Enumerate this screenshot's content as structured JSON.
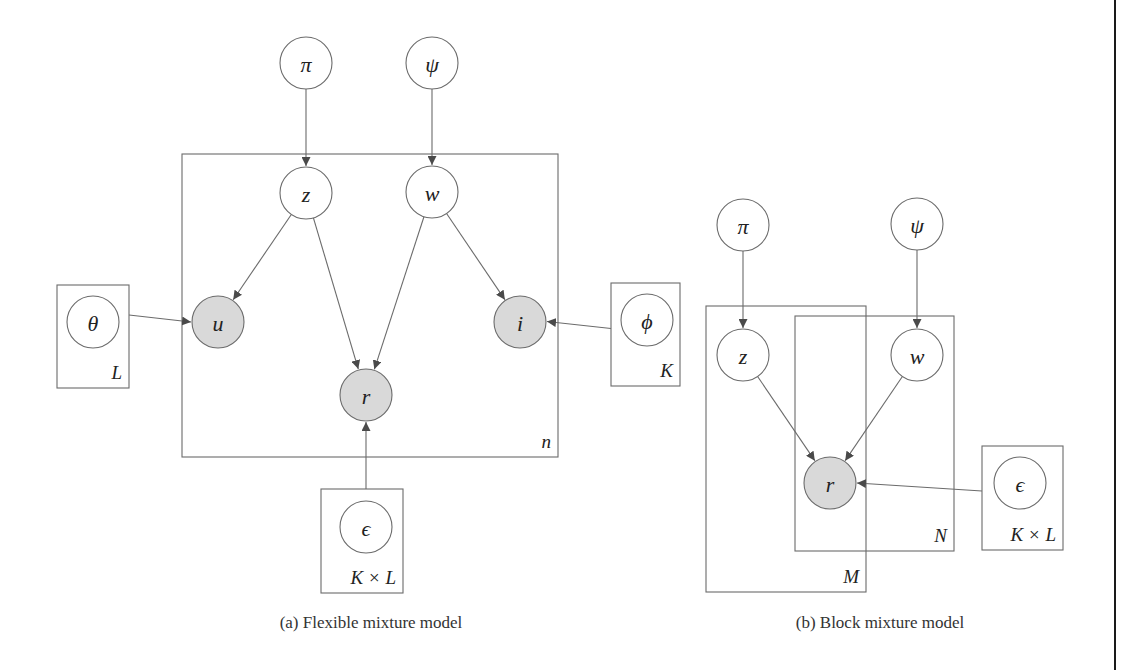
{
  "figures": [
    {
      "id": "a",
      "caption": "(a)  Flexible mixture model",
      "nodes": [
        {
          "id": "pi",
          "label": "π",
          "x": 306,
          "y": 63,
          "observed": false
        },
        {
          "id": "psi",
          "label": "ψ",
          "x": 432,
          "y": 63,
          "observed": false
        },
        {
          "id": "z",
          "label": "z",
          "x": 306,
          "y": 193,
          "observed": false
        },
        {
          "id": "w",
          "label": "w",
          "x": 432,
          "y": 192,
          "observed": false
        },
        {
          "id": "u",
          "label": "u",
          "x": 218,
          "y": 322,
          "observed": true
        },
        {
          "id": "i",
          "label": "i",
          "x": 520,
          "y": 322,
          "observed": true
        },
        {
          "id": "r",
          "label": "r",
          "x": 366,
          "y": 395,
          "observed": true
        },
        {
          "id": "theta",
          "label": "θ",
          "x": 93,
          "y": 322,
          "observed": false
        },
        {
          "id": "phi",
          "label": "ϕ",
          "x": 647,
          "y": 320,
          "observed": false
        },
        {
          "id": "epsilon",
          "label": "ϵ",
          "x": 366,
          "y": 527,
          "observed": false
        }
      ],
      "plates": [
        {
          "id": "n",
          "label": "n",
          "x": 182,
          "y": 154,
          "w": 376,
          "h": 303
        },
        {
          "id": "L",
          "label": "L",
          "x": 57,
          "y": 285,
          "w": 72,
          "h": 103
        },
        {
          "id": "K",
          "label": "K",
          "x": 611,
          "y": 283,
          "w": 69,
          "h": 103
        },
        {
          "id": "KxL",
          "label": "K × L",
          "x": 321,
          "y": 489,
          "w": 82,
          "h": 104
        }
      ],
      "edges": [
        [
          "pi",
          "z"
        ],
        [
          "psi",
          "w"
        ],
        [
          "z",
          "u"
        ],
        [
          "z",
          "r"
        ],
        [
          "w",
          "r"
        ],
        [
          "w",
          "i"
        ],
        [
          "theta",
          "u"
        ],
        [
          "phi",
          "i"
        ],
        [
          "epsilon",
          "r"
        ]
      ]
    },
    {
      "id": "b",
      "caption": "(b)  Block mixture model",
      "nodes": [
        {
          "id": "pi",
          "label": "π",
          "x": 743,
          "y": 225,
          "observed": false
        },
        {
          "id": "psi",
          "label": "ψ",
          "x": 917,
          "y": 224,
          "observed": false
        },
        {
          "id": "z",
          "label": "z",
          "x": 743,
          "y": 355,
          "observed": false
        },
        {
          "id": "w",
          "label": "w",
          "x": 917,
          "y": 355,
          "observed": false
        },
        {
          "id": "r",
          "label": "r",
          "x": 830,
          "y": 483,
          "observed": true
        },
        {
          "id": "epsilon",
          "label": "ϵ",
          "x": 1020,
          "y": 483,
          "observed": false
        }
      ],
      "plates": [
        {
          "id": "M",
          "label": "M",
          "x": 706,
          "y": 306,
          "w": 160,
          "h": 286
        },
        {
          "id": "N",
          "label": "N",
          "x": 795,
          "y": 316,
          "w": 159,
          "h": 235
        },
        {
          "id": "KxL",
          "label": "K × L",
          "x": 982,
          "y": 446,
          "w": 81,
          "h": 104
        }
      ],
      "edges": [
        [
          "pi",
          "z"
        ],
        [
          "psi",
          "w"
        ],
        [
          "z",
          "r"
        ],
        [
          "w",
          "r"
        ],
        [
          "epsilon",
          "r"
        ]
      ]
    }
  ],
  "style": {
    "node_radius": 26,
    "stroke_color": "#6b6b6b",
    "observed_fill": "#d9d9d9",
    "arrow_color": "#4a4a4a",
    "caption_y": 628
  }
}
